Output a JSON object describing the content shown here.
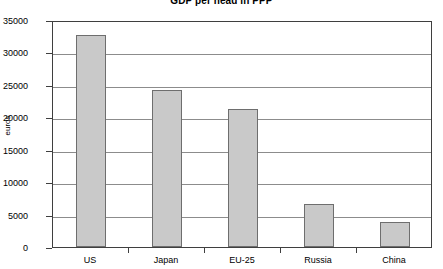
{
  "chart_data": {
    "type": "bar",
    "title": "GDP per head in PPP",
    "xlabel": "",
    "ylabel": "euros",
    "categories": [
      "US",
      "Japan",
      "EU-25",
      "Russia",
      "China"
    ],
    "values": [
      32700,
      24200,
      21300,
      6700,
      3800
    ],
    "ylim": [
      0,
      35000
    ],
    "ytick_values": [
      0,
      5000,
      10000,
      15000,
      20000,
      25000,
      30000,
      35000
    ],
    "ytick_labels": [
      "0",
      "5000",
      "10000",
      "15000",
      "20000",
      "25000",
      "30000",
      "35000"
    ],
    "grid": true,
    "legend": false,
    "legend_position": "none",
    "bar_fill_color": "#c9c9c9",
    "bar_border_color": "#6e6e6e",
    "gridline_color": "#8c8c8c",
    "axis_color": "#3f3f3f",
    "background_color": "#ffffff"
  }
}
